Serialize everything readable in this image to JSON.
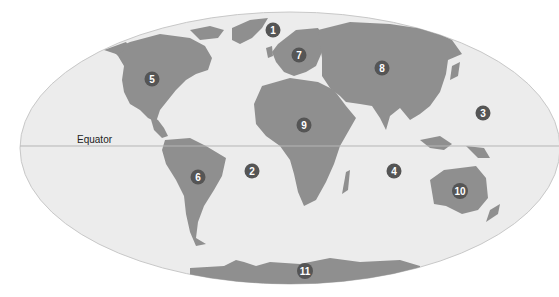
{
  "map": {
    "projection": "world-ellipse",
    "colors": {
      "ocean": "#ececec",
      "land": "#8f8f8f",
      "border": "#c8c8c8",
      "marker": "#555555",
      "marker_text": "#ffffff",
      "equator_line": "#b5b5b5"
    },
    "equator": {
      "label": "Equator"
    },
    "markers": [
      {
        "id": "1",
        "label": "1",
        "x": 273,
        "y": 30
      },
      {
        "id": "2",
        "label": "2",
        "x": 252,
        "y": 171
      },
      {
        "id": "3",
        "label": "3",
        "x": 483,
        "y": 113
      },
      {
        "id": "4",
        "label": "4",
        "x": 394,
        "y": 171
      },
      {
        "id": "5",
        "label": "5",
        "x": 152,
        "y": 79
      },
      {
        "id": "6",
        "label": "6",
        "x": 198,
        "y": 177
      },
      {
        "id": "7",
        "label": "7",
        "x": 299,
        "y": 55
      },
      {
        "id": "8",
        "label": "8",
        "x": 382,
        "y": 68
      },
      {
        "id": "9",
        "label": "9",
        "x": 304,
        "y": 125
      },
      {
        "id": "10",
        "label": "10",
        "x": 460,
        "y": 191
      },
      {
        "id": "11",
        "label": "11",
        "x": 305,
        "y": 271
      }
    ]
  }
}
